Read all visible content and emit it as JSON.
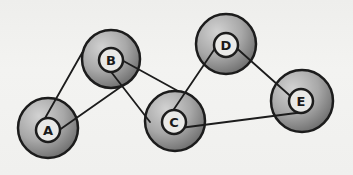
{
  "diagram": {
    "type": "graph",
    "colors": {
      "background": "#f1f1ef",
      "stroke": "#1c1c1c",
      "node_fill_light": "#c8c8c8",
      "node_fill_dark": "#7a7a7a",
      "label_fill": "#ececec"
    },
    "nodes": [
      {
        "id": "A",
        "label": "A",
        "cx": 48,
        "cy": 128,
        "r": 30,
        "inner_r": 12
      },
      {
        "id": "B",
        "label": "B",
        "cx": 111,
        "cy": 59,
        "r": 29,
        "inner_r": 12
      },
      {
        "id": "C",
        "label": "C",
        "cx": 175,
        "cy": 121,
        "r": 30,
        "inner_r": 12
      },
      {
        "id": "D",
        "label": "D",
        "cx": 226,
        "cy": 44,
        "r": 30,
        "inner_r": 12
      },
      {
        "id": "E",
        "label": "E",
        "cx": 302,
        "cy": 101,
        "r": 31,
        "inner_r": 12
      }
    ],
    "edges": [
      {
        "from": "A",
        "to": "B"
      },
      {
        "from": "A",
        "to": "B"
      },
      {
        "from": "B",
        "to": "C"
      },
      {
        "from": "B",
        "to": "C"
      },
      {
        "from": "C",
        "to": "D"
      },
      {
        "from": "D",
        "to": "E"
      },
      {
        "from": "C",
        "to": "E"
      }
    ]
  }
}
